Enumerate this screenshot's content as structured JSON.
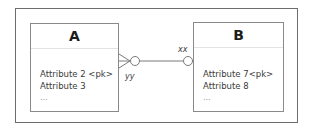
{
  "diagram": {
    "type": "er-diagram",
    "notation": "crow's foot",
    "entities": [
      {
        "id": "A",
        "title": "A",
        "attributes": [
          "Attribute 2 <pk>",
          "Attribute 3",
          "..."
        ]
      },
      {
        "id": "B",
        "title": "B",
        "attributes": [
          "Attribute 7<pk>",
          "Attribute 8",
          "..."
        ]
      }
    ],
    "relationship": {
      "from": "A",
      "to": "B",
      "from_end": "zero-or-many",
      "to_end": "zero-or-one",
      "from_role": "yy",
      "to_role": "xx"
    },
    "colors": {
      "frame": "#6d6d6d",
      "entity_border": "#8a8a8a",
      "line": "#7a7a7a",
      "text": "#3a3a3a"
    }
  }
}
